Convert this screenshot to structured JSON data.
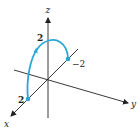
{
  "diagram": {
    "type": "3d-parametric-curve",
    "axes": {
      "x": {
        "label": "x"
      },
      "y": {
        "label": "y"
      },
      "z": {
        "label": "z"
      }
    },
    "tick_labels": {
      "x_point": "2",
      "z_top": "2",
      "y_point": "−2"
    },
    "colors": {
      "axis": "#222222",
      "curve": "#2aa7d6"
    },
    "curve": {
      "description": "Half-circle arc from (2,0,0) rising through z=2 to (0,-2,0), with direction arrow",
      "start_point": "2 on x-axis",
      "peak": "2 on z-axis",
      "end_point": "-2 on y-axis"
    }
  }
}
